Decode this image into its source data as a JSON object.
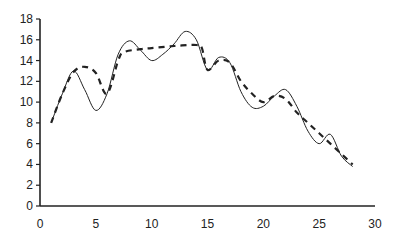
{
  "chart_data": {
    "type": "line",
    "title": "",
    "xlabel": "",
    "ylabel": "",
    "xlim": [
      0,
      30
    ],
    "ylim": [
      0,
      18
    ],
    "x_ticks": [
      0,
      5,
      10,
      15,
      20,
      25,
      30
    ],
    "y_ticks": [
      0,
      2,
      4,
      6,
      8,
      10,
      12,
      14,
      16,
      18
    ],
    "grid": false,
    "legend": null,
    "series": [
      {
        "name": "solid",
        "style": "solid",
        "color": "#222222",
        "points": [
          [
            1,
            8.0
          ],
          [
            2,
            10.8
          ],
          [
            3,
            13.0
          ],
          [
            4,
            11.2
          ],
          [
            5,
            9.2
          ],
          [
            6,
            10.8
          ],
          [
            7,
            14.6
          ],
          [
            8,
            15.9
          ],
          [
            9,
            15.0
          ],
          [
            10,
            14.0
          ],
          [
            11,
            14.6
          ],
          [
            12,
            15.6
          ],
          [
            13,
            16.8
          ],
          [
            14,
            16.0
          ],
          [
            15,
            13.1
          ],
          [
            16,
            14.3
          ],
          [
            17,
            13.8
          ],
          [
            18,
            11.0
          ],
          [
            19,
            9.5
          ],
          [
            20,
            9.6
          ],
          [
            21,
            10.6
          ],
          [
            22,
            11.2
          ],
          [
            23,
            9.6
          ],
          [
            24,
            7.2
          ],
          [
            25,
            6.0
          ],
          [
            26,
            6.9
          ],
          [
            27,
            4.8
          ],
          [
            28,
            3.8
          ]
        ]
      },
      {
        "name": "dashed",
        "style": "dashed",
        "color": "#222222",
        "points": [
          [
            1,
            8.0
          ],
          [
            2,
            10.8
          ],
          [
            3,
            12.9
          ],
          [
            4,
            13.4
          ],
          [
            5,
            12.8
          ],
          [
            6,
            10.8
          ],
          [
            7,
            14.0
          ],
          [
            7.5,
            14.8
          ],
          [
            9,
            15.1
          ],
          [
            10,
            15.2
          ],
          [
            12,
            15.4
          ],
          [
            14,
            15.5
          ],
          [
            14.5,
            15.2
          ],
          [
            15,
            13.1
          ],
          [
            16,
            14.0
          ],
          [
            17,
            13.8
          ],
          [
            18,
            12.0
          ],
          [
            19,
            10.8
          ],
          [
            20,
            10.0
          ],
          [
            21,
            10.6
          ],
          [
            22,
            10.3
          ],
          [
            23,
            9.0
          ],
          [
            24,
            8.0
          ],
          [
            25,
            7.0
          ],
          [
            26,
            6.0
          ],
          [
            27,
            5.0
          ],
          [
            28,
            4.0
          ]
        ]
      }
    ]
  }
}
